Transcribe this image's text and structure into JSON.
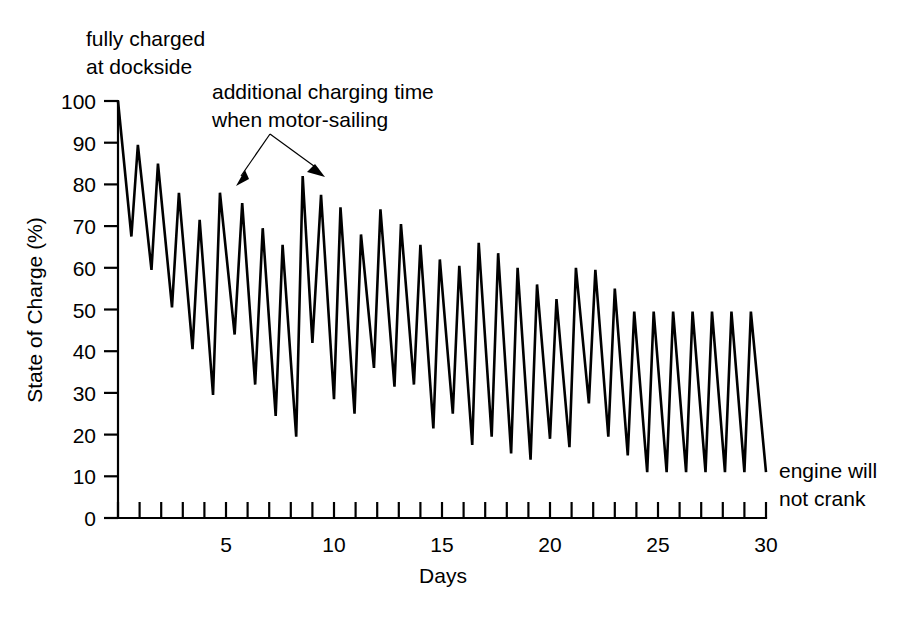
{
  "chart_data": {
    "type": "line",
    "title": "",
    "subtitle": "",
    "xlabel": "Days",
    "ylabel": "State of Charge (%)",
    "xlim": [
      0,
      30
    ],
    "ylim": [
      0,
      100
    ],
    "grid": false,
    "legend": "none",
    "x_ticks_major": [
      5,
      10,
      15,
      20,
      25,
      30
    ],
    "x_tick_labels": [
      "5",
      "10",
      "15",
      "20",
      "25",
      "30"
    ],
    "x_ticks_minor_step": 1,
    "y_ticks": [
      0,
      10,
      20,
      30,
      40,
      50,
      60,
      70,
      80,
      90,
      100
    ],
    "y_tick_labels": [
      "0",
      "10",
      "20",
      "30",
      "40",
      "50",
      "60",
      "70",
      "80",
      "90",
      "100"
    ],
    "series": [
      {
        "name": "State of Charge",
        "x": [
          0.0,
          0.62,
          0.92,
          1.55,
          1.85,
          2.5,
          2.82,
          3.45,
          3.78,
          4.4,
          4.72,
          5.4,
          5.75,
          6.35,
          6.7,
          7.3,
          7.62,
          8.25,
          8.55,
          9.0,
          9.4,
          10.0,
          10.3,
          10.95,
          11.25,
          11.85,
          12.15,
          12.8,
          13.1,
          13.7,
          14.0,
          14.6,
          14.9,
          15.5,
          15.8,
          16.4,
          16.7,
          17.3,
          17.6,
          18.2,
          18.5,
          19.1,
          19.4,
          20.0,
          20.3,
          20.9,
          21.2,
          21.8,
          22.1,
          22.7,
          23.0,
          23.6,
          23.9,
          24.5,
          24.8,
          25.4,
          25.7,
          26.3,
          26.6,
          27.2,
          27.5,
          28.1,
          28.4,
          29.0,
          29.3,
          30.0
        ],
        "y": [
          100,
          67.5,
          89.5,
          59.5,
          85,
          50.5,
          78,
          40.5,
          71.5,
          29.5,
          78,
          44,
          75.5,
          32,
          69.5,
          24.5,
          65.5,
          19.5,
          82,
          42,
          77.5,
          28.5,
          74.5,
          25,
          68,
          36,
          74,
          31.5,
          70.5,
          32,
          65.5,
          21.5,
          62,
          25,
          60.5,
          17.5,
          66,
          19.5,
          63.5,
          15.5,
          60,
          14,
          56,
          19,
          52.5,
          17,
          60,
          27.5,
          59.5,
          19.5,
          55,
          15,
          49.5,
          11,
          49.5,
          11,
          49.5,
          11,
          49.5,
          11,
          49.5,
          11,
          49.5,
          11,
          49.5,
          11
        ]
      }
    ],
    "annotations": [
      {
        "id": "fully-charged",
        "text_lines": [
          "fully charged",
          "at dockside"
        ],
        "points_to": {
          "x": 0,
          "y": 100
        }
      },
      {
        "id": "additional-charging",
        "text_lines": [
          "additional charging time",
          "when motor-sailing"
        ],
        "points_to_multiple": [
          {
            "x": 5.4,
            "y": 78
          },
          {
            "x": 9.0,
            "y": 82
          }
        ]
      },
      {
        "id": "engine-will-not-crank",
        "text_lines": [
          "engine will",
          "not crank"
        ],
        "points_to": {
          "x": 30,
          "y": 11
        }
      }
    ],
    "colors": {
      "line": "#000000",
      "axis": "#000000",
      "background": "#ffffff",
      "text": "#000000"
    }
  },
  "annotation_top_left": {
    "line1": "fully charged",
    "line2": "at dockside"
  },
  "annotation_motor_sailing": {
    "line1": "additional charging time",
    "line2": "when motor-sailing"
  },
  "annotation_engine": {
    "line1": "engine will",
    "line2": "not crank"
  },
  "axes": {
    "y_title": "State of Charge (%)",
    "x_title": "Days"
  }
}
